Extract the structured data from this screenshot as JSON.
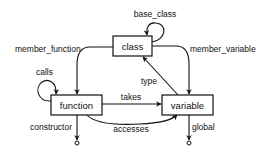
{
  "diagram": {
    "nodes": [
      {
        "id": "class",
        "label": "class"
      },
      {
        "id": "function",
        "label": "function"
      },
      {
        "id": "variable",
        "label": "variable"
      }
    ],
    "edges": [
      {
        "id": "base_class",
        "label": "base_class",
        "from": "class",
        "to": "class"
      },
      {
        "id": "member_function",
        "label": "member_function",
        "from": "class",
        "to": "function"
      },
      {
        "id": "member_variable",
        "label": "member_variable",
        "from": "class",
        "to": "variable"
      },
      {
        "id": "calls",
        "label": "calls",
        "from": "function",
        "to": "function"
      },
      {
        "id": "takes",
        "label": "takes",
        "from": "function",
        "to": "variable"
      },
      {
        "id": "type",
        "label": "type",
        "from": "variable",
        "to": "class"
      },
      {
        "id": "accesses",
        "label": "accesses",
        "from": "function",
        "to": "variable"
      },
      {
        "id": "constructor",
        "label": "constructor",
        "from": "function",
        "to": "terminal"
      },
      {
        "id": "global",
        "label": "global",
        "from": "variable",
        "to": "terminal"
      }
    ]
  }
}
